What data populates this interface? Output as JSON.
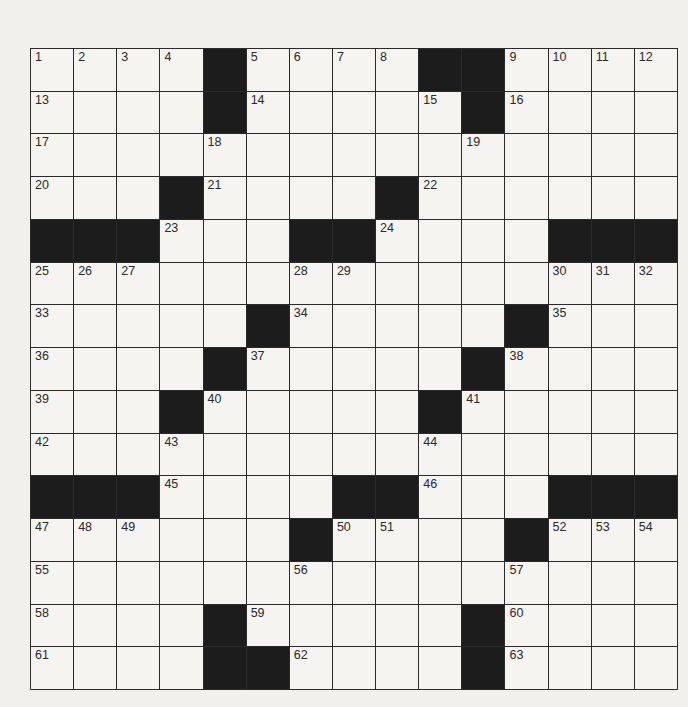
{
  "puzzle": {
    "rows": 15,
    "cols": 15,
    "colors": {
      "black_cell": "#1c1c1c",
      "white_cell": "#f5f4f0",
      "grid_line": "#2a2a2a",
      "background": "#f1f0ec"
    },
    "grid": [
      ".....#....##....",
      "....#.....#....",
      "...............",
      "...#....#......",
      "###...##....###",
      "...............",
      ".....#.....#...",
      "....#.....#....",
      "...#.....#.....",
      "...............",
      "###....##...###",
      "......#....#...",
      "...............",
      "....#.....#....",
      "....##....#...."
    ],
    "numbers": [
      {
        "r": 0,
        "c": 0,
        "n": "1"
      },
      {
        "r": 0,
        "c": 1,
        "n": "2"
      },
      {
        "r": 0,
        "c": 2,
        "n": "3"
      },
      {
        "r": 0,
        "c": 3,
        "n": "4"
      },
      {
        "r": 0,
        "c": 5,
        "n": "5"
      },
      {
        "r": 0,
        "c": 6,
        "n": "6"
      },
      {
        "r": 0,
        "c": 7,
        "n": "7"
      },
      {
        "r": 0,
        "c": 8,
        "n": "8"
      },
      {
        "r": 0,
        "c": 11,
        "n": "9"
      },
      {
        "r": 0,
        "c": 12,
        "n": "10"
      },
      {
        "r": 0,
        "c": 13,
        "n": "11"
      },
      {
        "r": 0,
        "c": 14,
        "n": "12"
      },
      {
        "r": 1,
        "c": 0,
        "n": "13"
      },
      {
        "r": 1,
        "c": 5,
        "n": "14"
      },
      {
        "r": 1,
        "c": 9,
        "n": "15"
      },
      {
        "r": 1,
        "c": 11,
        "n": "16"
      },
      {
        "r": 2,
        "c": 0,
        "n": "17"
      },
      {
        "r": 2,
        "c": 4,
        "n": "18"
      },
      {
        "r": 2,
        "c": 10,
        "n": "19"
      },
      {
        "r": 3,
        "c": 0,
        "n": "20"
      },
      {
        "r": 3,
        "c": 4,
        "n": "21"
      },
      {
        "r": 3,
        "c": 9,
        "n": "22"
      },
      {
        "r": 4,
        "c": 3,
        "n": "23"
      },
      {
        "r": 4,
        "c": 8,
        "n": "24"
      },
      {
        "r": 5,
        "c": 0,
        "n": "25"
      },
      {
        "r": 5,
        "c": 1,
        "n": "26"
      },
      {
        "r": 5,
        "c": 2,
        "n": "27"
      },
      {
        "r": 5,
        "c": 6,
        "n": "28"
      },
      {
        "r": 5,
        "c": 7,
        "n": "29"
      },
      {
        "r": 5,
        "c": 12,
        "n": "30"
      },
      {
        "r": 5,
        "c": 13,
        "n": "31"
      },
      {
        "r": 5,
        "c": 14,
        "n": "32"
      },
      {
        "r": 6,
        "c": 0,
        "n": "33"
      },
      {
        "r": 6,
        "c": 6,
        "n": "34"
      },
      {
        "r": 6,
        "c": 12,
        "n": "35"
      },
      {
        "r": 7,
        "c": 0,
        "n": "36"
      },
      {
        "r": 7,
        "c": 5,
        "n": "37"
      },
      {
        "r": 7,
        "c": 11,
        "n": "38"
      },
      {
        "r": 8,
        "c": 0,
        "n": "39"
      },
      {
        "r": 8,
        "c": 4,
        "n": "40"
      },
      {
        "r": 8,
        "c": 10,
        "n": "41"
      },
      {
        "r": 9,
        "c": 0,
        "n": "42"
      },
      {
        "r": 9,
        "c": 3,
        "n": "43"
      },
      {
        "r": 9,
        "c": 9,
        "n": "44"
      },
      {
        "r": 10,
        "c": 3,
        "n": "45"
      },
      {
        "r": 10,
        "c": 9,
        "n": "46"
      },
      {
        "r": 11,
        "c": 0,
        "n": "47"
      },
      {
        "r": 11,
        "c": 1,
        "n": "48"
      },
      {
        "r": 11,
        "c": 2,
        "n": "49"
      },
      {
        "r": 11,
        "c": 7,
        "n": "50"
      },
      {
        "r": 11,
        "c": 8,
        "n": "51"
      },
      {
        "r": 11,
        "c": 12,
        "n": "52"
      },
      {
        "r": 11,
        "c": 13,
        "n": "53"
      },
      {
        "r": 11,
        "c": 14,
        "n": "54"
      },
      {
        "r": 12,
        "c": 0,
        "n": "55"
      },
      {
        "r": 12,
        "c": 6,
        "n": "56"
      },
      {
        "r": 12,
        "c": 11,
        "n": "57"
      },
      {
        "r": 13,
        "c": 0,
        "n": "58"
      },
      {
        "r": 13,
        "c": 5,
        "n": "59"
      },
      {
        "r": 13,
        "c": 11,
        "n": "60"
      },
      {
        "r": 14,
        "c": 0,
        "n": "61"
      },
      {
        "r": 14,
        "c": 6,
        "n": "62"
      },
      {
        "r": 14,
        "c": 11,
        "n": "63"
      }
    ]
  }
}
